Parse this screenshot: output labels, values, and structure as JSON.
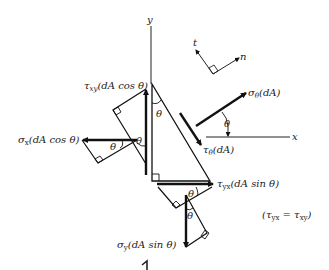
{
  "diagram": {
    "axes": {
      "x_label": "x",
      "y_label": "y"
    },
    "local_axes": {
      "t_label": "t",
      "n_label": "n"
    },
    "angle_symbol": "θ",
    "forces": {
      "tau_xy": {
        "sym": "τ",
        "sub": "xy",
        "arg": "(dA cos θ)"
      },
      "sigma_x": {
        "sym": "σ",
        "sub": "x",
        "arg": "(dA cos θ)"
      },
      "sigma_theta": {
        "sym": "σ",
        "sub": "θ",
        "arg": "(dA)"
      },
      "tau_theta": {
        "sym": "τ",
        "sub": "θ",
        "arg": "(dA)"
      },
      "tau_yx": {
        "sym": "τ",
        "sub": "yx",
        "arg": "(dA sin θ)"
      },
      "sigma_y": {
        "sym": "σ",
        "sub": "y",
        "arg": "(dA sin θ)"
      }
    },
    "relation": {
      "text": "(τ",
      "sub1": "yx",
      "eq": " = τ",
      "sub2": "xy",
      "close": ")"
    }
  }
}
